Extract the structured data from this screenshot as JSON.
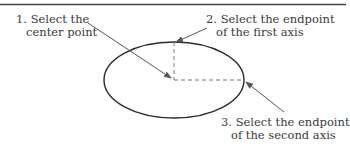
{
  "diagram": {
    "steps": [
      {
        "number": "1.",
        "line1": "1. Select the",
        "line2": "center point"
      },
      {
        "number": "2.",
        "line1": "2. Select the endpoint",
        "line2": "of the first axis"
      },
      {
        "number": "3.",
        "line1": "3. Select the endpoint",
        "line2": "of the second axis"
      }
    ],
    "colors": {
      "stroke": "#2b2b2b",
      "arrow": "#555555",
      "dashed": "#777777",
      "rule": "#444444",
      "text": "#3a3a3a"
    },
    "shapes": {
      "ellipse": {
        "cx": 174,
        "cy": 80,
        "rx": 70,
        "ry": 38
      },
      "first_axis_endpoint": {
        "x": 174,
        "y": 42
      },
      "second_axis_endpoint": {
        "x": 244,
        "y": 80
      }
    }
  }
}
